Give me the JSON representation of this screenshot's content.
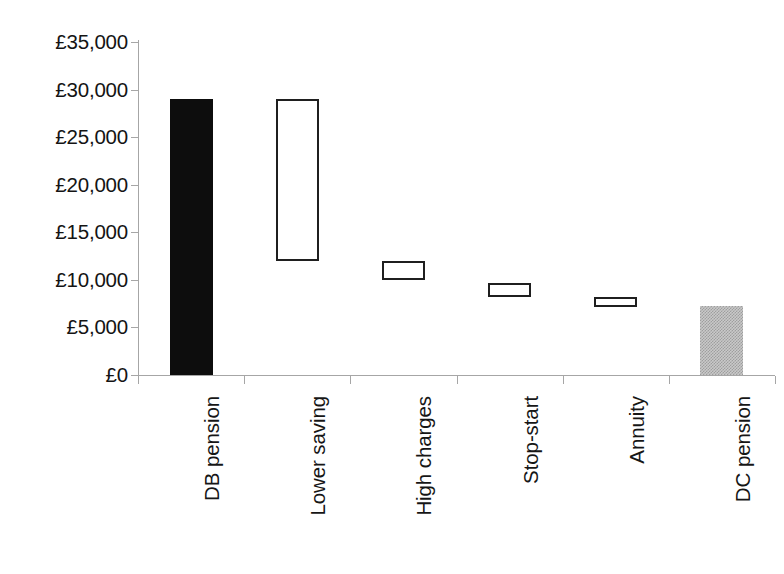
{
  "chart_data": {
    "type": "bar",
    "subtype": "waterfall",
    "title": "",
    "xlabel": "",
    "ylabel": "",
    "currency_symbol": "£",
    "ylim": [
      0,
      35000
    ],
    "ytick_step": 5000,
    "grid": false,
    "legend": false,
    "categories": [
      "DB pension",
      "Lower saving",
      "High charges",
      "Stop-start",
      "Annuity",
      "DC pension"
    ],
    "ytick_labels": [
      "£35,000",
      "£30,000",
      "£25,000",
      "£20,000",
      "£15,000",
      "£10,000",
      "£5,000",
      "£0"
    ],
    "ytick_values": [
      35000,
      30000,
      25000,
      20000,
      15000,
      10000,
      5000,
      0
    ],
    "bars": [
      {
        "category": "DB pension",
        "bottom": 0,
        "top": 29000,
        "value": 29000,
        "style": "solid-black",
        "fill": "#0d0d0d"
      },
      {
        "category": "Lower saving",
        "bottom": 12000,
        "top": 29000,
        "value": -17000,
        "style": "outline",
        "fill": "#ffffff"
      },
      {
        "category": "High charges",
        "bottom": 10000,
        "top": 12000,
        "value": -2000,
        "style": "outline",
        "fill": "#ffffff"
      },
      {
        "category": "Stop-start",
        "bottom": 8200,
        "top": 9700,
        "value": -1500,
        "style": "outline",
        "fill": "#ffffff"
      },
      {
        "category": "Annuity",
        "bottom": 7200,
        "top": 8200,
        "value": -1000,
        "style": "outline",
        "fill": "#ffffff"
      },
      {
        "category": "DC pension",
        "bottom": 0,
        "top": 7200,
        "value": 7200,
        "style": "gray-pattern",
        "fill": "#c9c9c9"
      }
    ],
    "axis_color": "#a6a6a6",
    "text_color": "#141414"
  }
}
